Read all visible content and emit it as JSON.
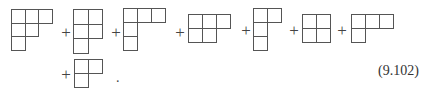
{
  "equation": {
    "number": "(9.102)",
    "operator": "+",
    "terminator": ".",
    "terms": [
      {
        "shape": [
          3,
          2,
          1
        ],
        "x": 11,
        "y": 9,
        "cell": 14.5
      },
      {
        "shape": [
          2,
          2,
          1
        ],
        "x": 73,
        "y": 9,
        "cell": 15.5
      },
      {
        "shape": [
          3,
          1,
          1
        ],
        "x": 123,
        "y": 8,
        "cell": 15
      },
      {
        "shape": [
          3,
          2
        ],
        "x": 188,
        "y": 14,
        "cell": 15
      },
      {
        "shape": [
          2,
          1,
          1
        ],
        "x": 253,
        "y": 8,
        "cell": 15
      },
      {
        "shape": [
          2,
          2
        ],
        "x": 302,
        "y": 14,
        "cell": 15
      },
      {
        "shape": [
          3,
          1
        ],
        "x": 351,
        "y": 14,
        "cell": 15
      },
      {
        "shape": [
          2,
          1
        ],
        "x": 74,
        "y": 59,
        "cell": 15
      }
    ],
    "plus_signs": [
      {
        "x": 66,
        "y": 32
      },
      {
        "x": 116,
        "y": 32
      },
      {
        "x": 180,
        "y": 32
      },
      {
        "x": 246,
        "y": 30
      },
      {
        "x": 294,
        "y": 30
      },
      {
        "x": 342,
        "y": 30
      },
      {
        "x": 66,
        "y": 74
      }
    ],
    "terminator_pos": {
      "x": 116,
      "y": 70
    },
    "number_pos": {
      "x": 378,
      "y": 63
    }
  }
}
